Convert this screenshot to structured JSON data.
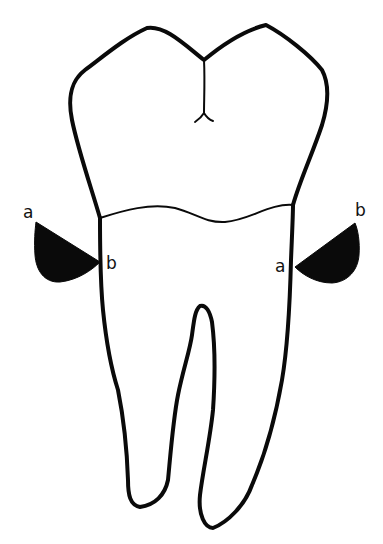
{
  "diagram": {
    "colors": {
      "stroke": "#0a0a0a",
      "fill": "#0a0a0a",
      "background": "#ffffff"
    },
    "left_wedge": {
      "label_top": "a",
      "label_bottom": "b"
    },
    "right_wedge": {
      "label_top": "b",
      "label_bottom": "a"
    }
  }
}
